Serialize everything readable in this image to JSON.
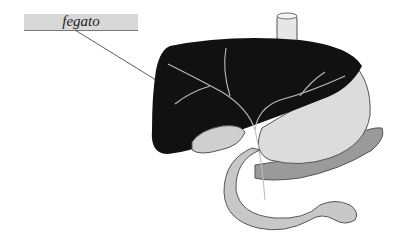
{
  "labels": [
    {
      "text": "fegato",
      "target": "liver"
    }
  ],
  "colors": {
    "label_bg": "#d8d8d8",
    "liver": "#111111",
    "organ_light": "#d9d9d9",
    "outline": "#555555"
  }
}
